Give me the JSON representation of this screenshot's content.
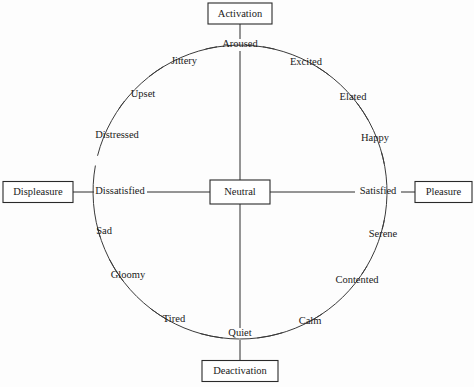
{
  "diagram": {
    "type": "circumplex-model-of-affect",
    "background_color": "#fdfdfd",
    "line_color": "#2d2d2d",
    "text_color": "#1a1a1a",
    "geometry": {
      "center_x": 240,
      "center_y": 192,
      "radius": 147,
      "canvas_width": 474,
      "canvas_height": 387
    },
    "axes": {
      "vertical_label_top": "Activation",
      "vertical_label_bottom": "Deactivation",
      "horizontal_label_left": "Displeasure",
      "horizontal_label_right": "Pleasure"
    },
    "center_node": {
      "label": "Neutral",
      "x": 240,
      "y": 192,
      "box_width": 60,
      "box_height": 24
    },
    "anchor_boxes": [
      {
        "name": "activation",
        "label": "Activation",
        "x": 240,
        "y": 13.5,
        "box_width": 64,
        "box_height": 21
      },
      {
        "name": "deactivation",
        "label": "Deactivation",
        "x": 240,
        "y": 371,
        "box_width": 76,
        "box_height": 21
      },
      {
        "name": "displeasure",
        "label": "Displeasure",
        "x": 38,
        "y": 192,
        "box_width": 70,
        "box_height": 21
      },
      {
        "name": "pleasure",
        "label": "Pleasure",
        "x": 443,
        "y": 192,
        "box_width": 57,
        "box_height": 21
      }
    ],
    "cardinal_labels": [
      {
        "name": "aroused",
        "label": "Aroused",
        "angle_deg": 90,
        "x": 240,
        "y": 45
      },
      {
        "name": "quiet",
        "label": "Quiet",
        "angle_deg": 270,
        "x": 240,
        "y": 334
      },
      {
        "name": "dissatisfied",
        "label": "Dissatisfied",
        "angle_deg": 180,
        "x": 120,
        "y": 192
      },
      {
        "name": "satisfied",
        "label": "Satisfied",
        "angle_deg": 0,
        "x": 378,
        "y": 192
      }
    ],
    "affect_labels": [
      {
        "name": "jittery",
        "label": "Jittery",
        "angle_deg": 112.5,
        "x": 184,
        "y": 62
      },
      {
        "name": "upset",
        "label": "Upset",
        "angle_deg": 135,
        "x": 143,
        "y": 95
      },
      {
        "name": "distressed",
        "label": "Distressed",
        "angle_deg": 157.5,
        "x": 117,
        "y": 136
      },
      {
        "name": "sad",
        "label": "Sad",
        "angle_deg": 202.5,
        "x": 104,
        "y": 232
      },
      {
        "name": "gloomy",
        "label": "Gloomy",
        "angle_deg": 225,
        "x": 128,
        "y": 276
      },
      {
        "name": "tired",
        "label": "Tired",
        "angle_deg": 247.5,
        "x": 174,
        "y": 320
      },
      {
        "name": "calm",
        "label": "Calm",
        "angle_deg": 292.5,
        "x": 310,
        "y": 322
      },
      {
        "name": "contented",
        "label": "Contented",
        "angle_deg": 315,
        "x": 357,
        "y": 281
      },
      {
        "name": "serene",
        "label": "Serene",
        "angle_deg": 337.5,
        "x": 383,
        "y": 235
      },
      {
        "name": "happy",
        "label": "Happy",
        "angle_deg": 22.5,
        "x": 375,
        "y": 139
      },
      {
        "name": "elated",
        "label": "Elated",
        "angle_deg": 45,
        "x": 353,
        "y": 98
      },
      {
        "name": "excited",
        "label": "Excited",
        "angle_deg": 67.5,
        "x": 306,
        "y": 63
      }
    ],
    "arc_segments": [
      {
        "from": "aroused",
        "to": "excited"
      },
      {
        "from": "excited",
        "to": "elated"
      },
      {
        "from": "elated",
        "to": "happy"
      },
      {
        "from": "happy",
        "to": "satisfied"
      },
      {
        "from": "satisfied",
        "to": "serene"
      },
      {
        "from": "serene",
        "to": "contented"
      },
      {
        "from": "contented",
        "to": "calm"
      },
      {
        "from": "calm",
        "to": "quiet"
      },
      {
        "from": "quiet",
        "to": "tired"
      },
      {
        "from": "tired",
        "to": "gloomy"
      },
      {
        "from": "gloomy",
        "to": "sad"
      },
      {
        "from": "sad",
        "to": "dissatisfied"
      },
      {
        "from": "dissatisfied",
        "to": "distressed"
      },
      {
        "from": "distressed",
        "to": "upset"
      },
      {
        "from": "upset",
        "to": "jittery"
      },
      {
        "from": "jittery",
        "to": "aroused"
      }
    ]
  }
}
